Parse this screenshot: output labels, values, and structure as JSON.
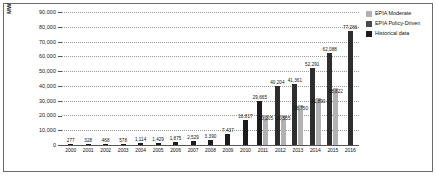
{
  "chart_data": {
    "type": "bar",
    "title": "",
    "subtitle": "",
    "xlabel": "",
    "ylabel": "MW",
    "ylim": [
      0,
      90000
    ],
    "y_ticks": [
      "0",
      "10,000",
      "20,000",
      "30,000",
      "40,000",
      "50,000",
      "60,000",
      "70,000",
      "80,000",
      "90,000"
    ],
    "grid": true,
    "legend_position": "right",
    "categories": [
      "2000",
      "2001",
      "2002",
      "2003",
      "2004",
      "2005",
      "2006",
      "2007",
      "2008",
      "2009",
      "2010",
      "2011",
      "2012",
      "2013",
      "2014",
      "2015",
      "2016"
    ],
    "series": [
      {
        "name": "Historical data",
        "color": "#1c1c1c",
        "values": [
          277,
          328,
          468,
          578,
          1114,
          1429,
          1875,
          2529,
          3390,
          7437,
          16817,
          29665,
          null,
          null,
          null,
          null,
          null
        ]
      },
      {
        "name": "EPIA Policy-Driven",
        "color": "#2e2e2e",
        "values": [
          null,
          null,
          null,
          null,
          null,
          null,
          null,
          null,
          null,
          null,
          null,
          null,
          40204,
          41361,
          52291,
          62088,
          77266
        ]
      },
      {
        "name": "EPIA Moderate",
        "color": "#b2b2b2",
        "values": [
          null,
          null,
          null,
          null,
          null,
          null,
          null,
          null,
          null,
          null,
          null,
          20205,
          20555,
          26750,
          31890,
          38822,
          null
        ]
      }
    ],
    "data_labels": {
      "2000": [
        "277"
      ],
      "2001": [
        "328"
      ],
      "2002": [
        "468"
      ],
      "2003": [
        "578"
      ],
      "2004": [
        "1,114"
      ],
      "2005": [
        "1,429"
      ],
      "2006": [
        "1,875"
      ],
      "2007": [
        "2,529"
      ],
      "2008": [
        "3,390"
      ],
      "2009": [
        "7,437"
      ],
      "2010": [
        "16,817"
      ],
      "2011": [
        "29,665",
        "20,205"
      ],
      "2012": [
        "40,204",
        "20,555"
      ],
      "2013": [
        "41,361",
        "26,750"
      ],
      "2014": [
        "52,291",
        "31,890"
      ],
      "2015": [
        "62,088",
        "38,822"
      ],
      "2016": [
        "77,266"
      ]
    }
  },
  "legend": {
    "items": [
      {
        "label": "EPIA Moderate",
        "swatch": "moderate"
      },
      {
        "label": "EPIA Policy-Driven",
        "swatch": "policy"
      },
      {
        "label": "Historical data",
        "swatch": "historical"
      }
    ]
  }
}
